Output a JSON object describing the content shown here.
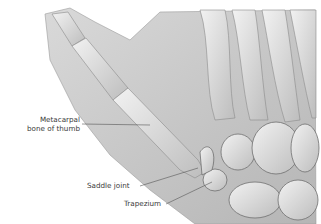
{
  "figure": {
    "labels": [
      {
        "id": "metacarpal",
        "lines": [
          "Metacarpal",
          "bone of thumb"
        ]
      },
      {
        "id": "saddle",
        "lines": [
          "Saddle joint"
        ]
      },
      {
        "id": "trapezium",
        "lines": [
          "Trapezium"
        ]
      }
    ]
  },
  "colors": {
    "background": "#ffffff",
    "skin": "#c9c9c9",
    "bone": "#e6e6e6",
    "shadow": "#8a8a8a",
    "leader_line": "#555555",
    "text": "#3a3a3a"
  }
}
